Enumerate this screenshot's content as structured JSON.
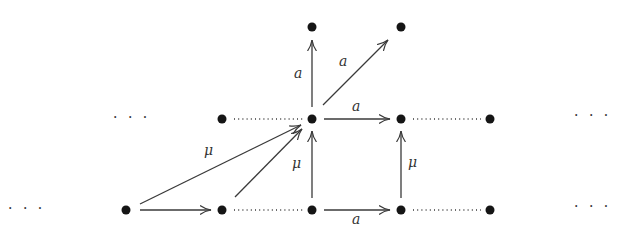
{
  "diagram": {
    "type": "commutative-lattice-diagram",
    "nodes": [
      {
        "id": "b0",
        "x": 126,
        "y": 210
      },
      {
        "id": "b1",
        "x": 222,
        "y": 210
      },
      {
        "id": "b2",
        "x": 312,
        "y": 210
      },
      {
        "id": "b3",
        "x": 401,
        "y": 210
      },
      {
        "id": "b4",
        "x": 490,
        "y": 210
      },
      {
        "id": "m1",
        "x": 222,
        "y": 119
      },
      {
        "id": "m2",
        "x": 312,
        "y": 119
      },
      {
        "id": "m3",
        "x": 401,
        "y": 119
      },
      {
        "id": "m4",
        "x": 490,
        "y": 119
      },
      {
        "id": "t2",
        "x": 312,
        "y": 27
      },
      {
        "id": "t3",
        "x": 401,
        "y": 27
      }
    ],
    "arrows": [
      {
        "from": "b0",
        "to": "b1",
        "label": ""
      },
      {
        "from": "b0",
        "to": "m2",
        "label": "μ"
      },
      {
        "from": "b1",
        "to": "m2",
        "label": ""
      },
      {
        "from": "b2",
        "to": "m2",
        "label": "μ"
      },
      {
        "from": "b2",
        "to": "b3",
        "label": "a"
      },
      {
        "from": "b3",
        "to": "m3",
        "label": "μ"
      },
      {
        "from": "m2",
        "to": "m3",
        "label": "a"
      },
      {
        "from": "m2",
        "to": "t2",
        "label": "a"
      },
      {
        "from": "m2",
        "to": "t3",
        "label": "a"
      }
    ],
    "dotted_edges": [
      {
        "from": "m1",
        "to": "m2"
      },
      {
        "from": "m3",
        "to": "m4"
      },
      {
        "from": "b1",
        "to": "b2"
      },
      {
        "from": "b3",
        "to": "b4"
      }
    ],
    "labels": {
      "mu_long": "μ",
      "mu_mid": "μ",
      "mu_right": "μ",
      "a_bottom": "a",
      "a_middle": "a",
      "a_vertical": "a",
      "a_diagonal": "a"
    },
    "ellipses": {
      "middle_left": "· · ·",
      "middle_right": "· · ·",
      "bottom_left": "· · ·",
      "bottom_right": "· · ·"
    }
  }
}
